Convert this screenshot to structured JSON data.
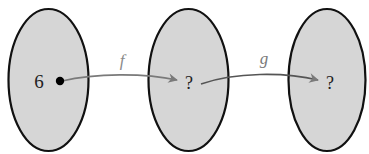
{
  "diagram": {
    "type": "function-composition-mapping",
    "colors": {
      "set_fill": "#d6d6d6",
      "set_stroke": "#111111",
      "arrow": "#7a7a7a",
      "text": "#222222",
      "function_label": "#8a8a8a"
    },
    "sets": [
      {
        "id": "domain",
        "element": "6"
      },
      {
        "id": "intermediate",
        "element": "?"
      },
      {
        "id": "codomain",
        "element": "?"
      }
    ],
    "arrows": [
      {
        "from": "domain",
        "to": "intermediate",
        "label": "f"
      },
      {
        "from": "intermediate",
        "to": "codomain",
        "label": "g"
      }
    ]
  }
}
